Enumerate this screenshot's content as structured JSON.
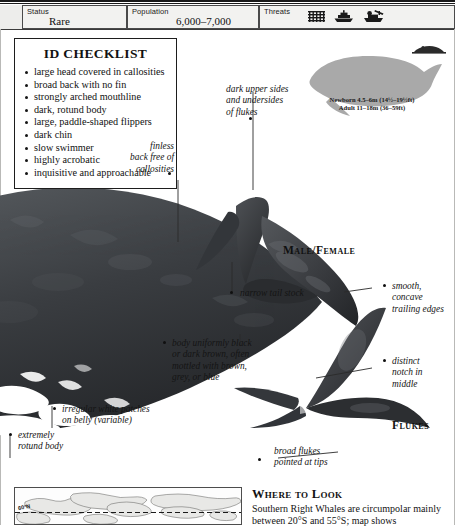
{
  "header": {
    "status": {
      "label": "Status",
      "value": "Rare"
    },
    "population": {
      "label": "Population",
      "value": "6,000–7,000"
    },
    "threats": {
      "label": "Threats",
      "icons": [
        "net-entanglement-icon",
        "ship-strike-icon",
        "whaling-boat-icon"
      ]
    }
  },
  "checklist": {
    "title": "ID CHECKLIST",
    "items": [
      "large head covered in callosities",
      "broad back with no fin",
      "strongly arched mouthline",
      "dark, rotund body",
      "large, paddle-shaped flippers",
      "dark chin",
      "slow swimmer",
      "highly acrobatic",
      "inquisitive and approachable"
    ]
  },
  "size": {
    "newborn": "Newborn 4.5–6m (14½–19½ft)",
    "adult": "Adult 11–18m (36–59ft)"
  },
  "captions": {
    "male_female": "Male/Female",
    "flukes": "Flukes"
  },
  "annotations": {
    "dark_upper": "dark upper sides\nand undersides\nof flukes",
    "finless_back": "finless\nback free of\ncallosities",
    "narrow_tail_stock": "narrow tail stock",
    "body_uniform": "body uniformly black\nor dark brown, often\nmottled with brown,\ngrey, or blue",
    "white_patches": "irregular white patches\non belly (variable)",
    "rotund_body": "extremely\nrotund body",
    "smooth_edges": "smooth,\nconcave\ntrailing edges",
    "distinct_notch": "distinct\nnotch in\nmiddle",
    "broad_flukes": "broad flukes\npointed at tips"
  },
  "map": {
    "latitude_label": "60°N"
  },
  "where_to_look": {
    "title": "Where to Look",
    "text": "Southern Right Whales are circumpolar mainly between 20°S and 55°S; map shows"
  },
  "colors": {
    "ink": "#141414",
    "header_bg": "#f2f2f0",
    "whale_dark": "#2e3033",
    "whale_mid": "#4a4d50",
    "silhouette": "#a9a9a9"
  }
}
